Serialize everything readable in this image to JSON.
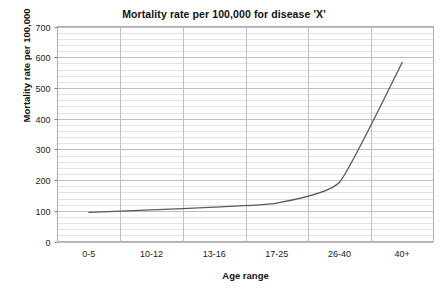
{
  "chart_data": {
    "type": "line",
    "title": "Mortality rate per 100,000 for disease 'X'",
    "xlabel": "Age range",
    "ylabel": "Mortality rate per 100,000",
    "categories": [
      "0-5",
      "10-12",
      "13-16",
      "17-25",
      "26-40",
      "40+"
    ],
    "values": [
      95,
      103,
      112,
      125,
      193,
      583
    ],
    "series": [
      {
        "name": "Mortality rate per 100,000",
        "values": [
          95,
          103,
          112,
          125,
          193,
          583
        ],
        "color": "#595959",
        "smoothed": true,
        "markers": false
      }
    ],
    "ylim": [
      0,
      700
    ],
    "y_ticks": [
      0,
      100,
      200,
      300,
      400,
      500,
      600,
      700
    ],
    "y_tick_labels": [
      "0",
      "100",
      "200",
      "300",
      "400",
      "500",
      "600",
      "700"
    ],
    "y_minor_tick_step": 20,
    "grid": {
      "horizontal_major": true,
      "horizontal_minor": true,
      "vertical_major": true,
      "major_color": "#bfbfbf",
      "minor_color": "#e3e3e3"
    },
    "legend": null,
    "legend_position": "none",
    "plot_border_color": "#b0b0b0",
    "background": "#ffffff"
  },
  "axes": {
    "y_title": "Mortality rate per 100,000",
    "x_title": "Age range"
  },
  "caption": {
    "fragment": ""
  }
}
